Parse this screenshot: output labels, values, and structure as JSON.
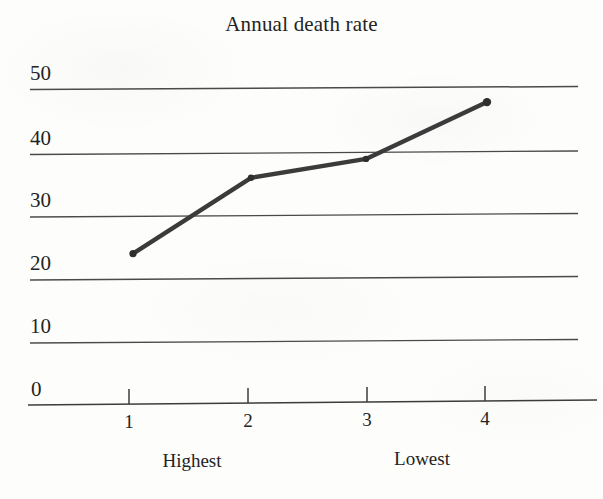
{
  "chart_data": {
    "type": "line",
    "title": "Annual death rate",
    "xlabel": "",
    "ylabel": "",
    "x": [
      1,
      2,
      3,
      4
    ],
    "categories": [
      "1",
      "2",
      "3",
      "4"
    ],
    "values": [
      24,
      36,
      39,
      48
    ],
    "series": [
      {
        "name": "Annual death rate",
        "values": [
          24,
          36,
          39,
          48
        ]
      }
    ],
    "ylim": [
      0,
      50
    ],
    "yticks": [
      0,
      10,
      20,
      30,
      40,
      50
    ],
    "ytick_labels": [
      "0",
      "10",
      "20",
      "30",
      "40",
      "50"
    ],
    "xticks": [
      1,
      2,
      3,
      4
    ],
    "xtick_labels": [
      "1",
      "2",
      "3",
      "4"
    ],
    "grid": true,
    "grid_axis": "y",
    "legend": false,
    "markers": true,
    "line_color": "#3b3b3b",
    "grid_color": "#4a4a4a",
    "axis_color": "#3c3c3c",
    "annotations": [
      {
        "text": "Highest",
        "near_xtick": "1"
      },
      {
        "text": "Lowest",
        "near_xtick": "4"
      }
    ]
  },
  "axes": {
    "y_labels": [
      "50",
      "40",
      "30",
      "20",
      "10",
      "0"
    ],
    "x_labels": [
      "1",
      "2",
      "3",
      "4"
    ],
    "captions": {
      "left": "Highest",
      "right": "Lowest"
    }
  }
}
